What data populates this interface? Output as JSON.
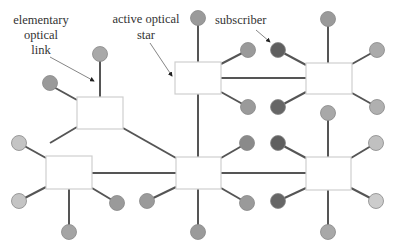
{
  "diagram": {
    "labels": {
      "elementary_link": [
        "elementary",
        "optical",
        "link"
      ],
      "active_star": [
        "active optical",
        "star"
      ],
      "subscriber": "subscriber"
    },
    "colors": {
      "line": "#555555",
      "box_fill": "#ffffff",
      "box_stroke": "#cfcfcf",
      "node_medium": "#9a9a9a",
      "node_light": "#c4c4c4",
      "node_dark": "#5f5f5f"
    },
    "stars": [
      {
        "id": "star-top-left",
        "x": 77,
        "y": 97,
        "w": 46,
        "h": 32
      },
      {
        "id": "star-top-middle",
        "x": 175,
        "y": 62,
        "w": 46,
        "h": 32
      },
      {
        "id": "star-top-right",
        "x": 306,
        "y": 63,
        "w": 46,
        "h": 31
      },
      {
        "id": "star-bottom-left",
        "x": 46,
        "y": 156,
        "w": 46,
        "h": 33
      },
      {
        "id": "star-bottom-middle",
        "x": 176,
        "y": 157,
        "w": 45,
        "h": 32
      },
      {
        "id": "star-bottom-right",
        "x": 306,
        "y": 157,
        "w": 45,
        "h": 33
      }
    ]
  }
}
